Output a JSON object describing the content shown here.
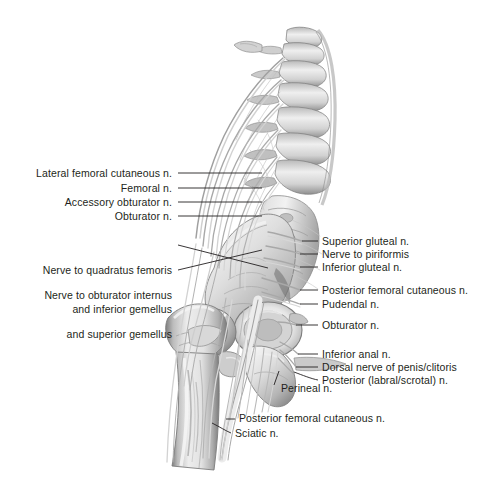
{
  "figure": {
    "width": 488,
    "height": 482,
    "background_color": "#ffffff",
    "label_color": "#231f20",
    "leader_color": "#231f20",
    "illustration_style": "grayscale pencil/airbrush medical illustration",
    "illustration_subject": "posterior-lateral view of lumbar spine, sacrum, pelvis, hip joint and proximal femur with lumbosacral plexus nerve branches"
  },
  "labels_left": [
    {
      "id": "lateral-femoral-cutaneous-n",
      "text": "Lateral femoral cutaneous n.",
      "lines": [
        "Lateral femoral cutaneous n."
      ],
      "text_x": 172,
      "text_y": 169,
      "leader": {
        "x1": 178,
        "y1": 173,
        "x2": 262,
        "y2": 173
      }
    },
    {
      "id": "femoral-n",
      "text": "Femoral n.",
      "lines": [
        "Femoral n."
      ],
      "text_x": 172,
      "text_y": 184,
      "leader": {
        "x1": 178,
        "y1": 188,
        "x2": 262,
        "y2": 188
      }
    },
    {
      "id": "accessory-obturator-n",
      "text": "Accessory obturator n.",
      "lines": [
        "Accessory obturator n."
      ],
      "text_x": 172,
      "text_y": 198,
      "leader": {
        "x1": 178,
        "y1": 202,
        "x2": 262,
        "y2": 202
      }
    },
    {
      "id": "obturator-n-left",
      "text": "Obturator n.",
      "lines": [
        "Obturator n."
      ],
      "text_x": 172,
      "text_y": 212,
      "leader": {
        "x1": 178,
        "y1": 216,
        "x2": 262,
        "y2": 216
      }
    },
    {
      "id": "nerve-to-quadratus-femoris-and-inferior-gemellus",
      "text": "Nerve to quadratus femoris and inferior gemellus",
      "lines": [
        "Nerve to quadratus femoris",
        "and inferior gemellus"
      ],
      "text_x": 172,
      "text_y": 240,
      "leader": {
        "x1": 178,
        "y1": 245,
        "x2": 268,
        "y2": 268
      }
    },
    {
      "id": "nerve-to-obturator-internus-and-superior-gemellus",
      "text": "Nerve to obturator internus and superior gemellus",
      "lines": [
        "Nerve to obturator internus",
        "and superior gemellus"
      ],
      "text_x": 172,
      "text_y": 265,
      "leader": {
        "x1": 178,
        "y1": 270,
        "x2": 262,
        "y2": 250
      }
    }
  ],
  "labels_right": [
    {
      "id": "superior-gluteal-n",
      "text": "Superior gluteal n.",
      "lines": [
        "Superior gluteal n."
      ],
      "text_x": 322,
      "text_y": 236,
      "leader": {
        "x1": 302,
        "y1": 241,
        "x2": 318,
        "y2": 241
      }
    },
    {
      "id": "nerve-to-piriformis",
      "text": "Nerve to piriformis",
      "lines": [
        "Nerve to piriformis"
      ],
      "text_x": 322,
      "text_y": 249,
      "leader": {
        "x1": 300,
        "y1": 254,
        "x2": 318,
        "y2": 254
      }
    },
    {
      "id": "inferior-gluteal-n",
      "text": "Inferior gluteal n.",
      "lines": [
        "Inferior gluteal n."
      ],
      "text_x": 322,
      "text_y": 262,
      "leader": {
        "x1": 300,
        "y1": 267,
        "x2": 318,
        "y2": 267
      }
    },
    {
      "id": "posterior-femoral-cutaneous-n-upper",
      "text": "Posterior femoral cutaneous n.",
      "lines": [
        "Posterior femoral cutaneous n."
      ],
      "text_x": 322,
      "text_y": 285,
      "leader": {
        "x1": 300,
        "y1": 290,
        "x2": 318,
        "y2": 290
      }
    },
    {
      "id": "pudendal-n",
      "text": "Pudendal n.",
      "lines": [
        "Pudendal n."
      ],
      "text_x": 322,
      "text_y": 299,
      "leader": {
        "x1": 300,
        "y1": 304,
        "x2": 318,
        "y2": 304
      }
    },
    {
      "id": "obturator-n-right",
      "text": "Obturator n.",
      "lines": [
        "Obturator n."
      ],
      "text_x": 322,
      "text_y": 320,
      "leader": {
        "x1": 296,
        "y1": 325,
        "x2": 318,
        "y2": 325
      }
    },
    {
      "id": "inferior-anal-n",
      "text": "Inferior anal n.",
      "lines": [
        "Inferior anal n."
      ],
      "text_x": 322,
      "text_y": 349,
      "leader": {
        "x1": 298,
        "y1": 354,
        "x2": 318,
        "y2": 354
      }
    },
    {
      "id": "dorsal-nerve-of-penis-clitoris",
      "text": "Dorsal nerve of penis/clitoris",
      "lines": [
        "Dorsal nerve of penis/clitoris"
      ],
      "text_x": 322,
      "text_y": 362,
      "leader": {
        "x1": 296,
        "y1": 367,
        "x2": 318,
        "y2": 367
      }
    },
    {
      "id": "posterior-labral-scrotal-n",
      "text": "Posterior (labral/scrotal) n.",
      "lines": [
        "Posterior (labral/scrotal) n."
      ],
      "text_x": 322,
      "text_y": 375,
      "leader": {
        "x1": 294,
        "y1": 373,
        "x2": 318,
        "y2": 380
      }
    }
  ],
  "labels_bottom": [
    {
      "id": "perineal-n",
      "text": "Perineal n.",
      "lines": [
        "Perineal n."
      ],
      "text_x": 276,
      "text_y": 388,
      "leader": {
        "x1": 272,
        "y1": 388,
        "x2": 278,
        "y2": 372
      }
    },
    {
      "id": "posterior-femoral-cutaneous-n-lower",
      "text": "Posterior femoral cutaneous n.",
      "lines": [
        "Posterior femoral cutaneous n."
      ],
      "text_x": 238,
      "text_y": 415,
      "leader": {
        "x1": 228,
        "y1": 420,
        "x2": 234,
        "y2": 420
      }
    },
    {
      "id": "sciatic-n",
      "text": "Sciatic n.",
      "lines": [
        "Sciatic n."
      ],
      "text_x": 234,
      "text_y": 429,
      "leader": {
        "x1": 214,
        "y1": 424,
        "x2": 230,
        "y2": 434
      }
    }
  ],
  "anatomy_structures": [
    {
      "name": "lumbar-vertebrae",
      "description": "stacked lumbar vertebral bodies, upper center-right"
    },
    {
      "name": "sacrum",
      "description": "sacrum with sacral foramina, center right"
    },
    {
      "name": "ilium",
      "description": "iliac wing / ilium, center"
    },
    {
      "name": "ischium",
      "description": "ischium and ischial spine, lower center"
    },
    {
      "name": "acetabulum",
      "description": "acetabulum socket of hip joint"
    },
    {
      "name": "femoral-head",
      "description": "head of femur in hip socket"
    },
    {
      "name": "greater-trochanter",
      "description": "greater trochanter of femur"
    },
    {
      "name": "lesser-trochanter",
      "description": "lesser trochanter of femur"
    },
    {
      "name": "femur-shaft",
      "description": "proximal shaft of femur descending to lower left"
    },
    {
      "name": "lumbosacral-plexus",
      "description": "network of nerve roots fanning from spine"
    },
    {
      "name": "sciatic-nerve-trunk",
      "description": "large sciatic nerve descending posterior to femur"
    }
  ]
}
